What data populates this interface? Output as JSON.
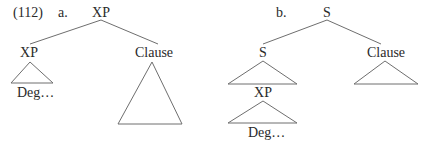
{
  "example_number": "(112)",
  "trees": [
    {
      "label": "a.",
      "root": "XP",
      "left_child": "XP",
      "left_child_content": "Deg…",
      "right_child": "Clause"
    },
    {
      "label": "b.",
      "root": "S",
      "left_child": "S",
      "left_embedded": "XP",
      "left_embedded_content": "Deg…",
      "right_child": "Clause"
    }
  ],
  "colors": {
    "line": "#6e6e6e",
    "text": "#2a2a2a",
    "background": "#ffffff"
  }
}
